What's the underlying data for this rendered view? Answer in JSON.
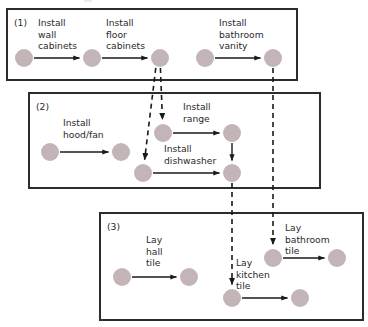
{
  "diagram": {
    "type": "precedence-network",
    "colors": {
      "node_fill": "#c3b4b8",
      "box_stroke": "#2c2c2c",
      "edge_solid": "#1a1a1a",
      "edge_dashed": "#1a1a1a",
      "background": "#ffffff"
    },
    "groups": [
      {
        "id": "group-1",
        "number": "(1)",
        "box": {
          "x": 7,
          "y": 9,
          "w": 290,
          "h": 71
        },
        "tasks": [
          {
            "id": "install-wall-cabinets",
            "label_lines": [
              "Install",
              "wall",
              "cabinets"
            ],
            "label_x": 38,
            "label_y": 26,
            "from": {
              "x": 24,
              "y": 58
            },
            "to": {
              "x": 92,
              "y": 58
            }
          },
          {
            "id": "install-floor-cabinets",
            "label_lines": [
              "Install",
              "floor",
              "cabinets"
            ],
            "label_x": 106,
            "label_y": 26,
            "from": {
              "x": 92,
              "y": 58
            },
            "to": {
              "x": 160,
              "y": 58
            }
          },
          {
            "id": "install-bathroom-vanity",
            "label_lines": [
              "Install",
              "bathroom",
              "vanity"
            ],
            "label_x": 219,
            "label_y": 26,
            "from": {
              "x": 205,
              "y": 58
            },
            "to": {
              "x": 273,
              "y": 58
            }
          }
        ]
      },
      {
        "id": "group-2",
        "number": "(2)",
        "box": {
          "x": 29,
          "y": 93,
          "w": 291,
          "h": 95
        },
        "tasks": [
          {
            "id": "install-hood-fan",
            "label_lines": [
              "Install",
              "hood/fan"
            ],
            "label_x": 63,
            "label_y": 126,
            "from": {
              "x": 50,
              "y": 152
            },
            "to": {
              "x": 121,
              "y": 152
            }
          },
          {
            "id": "install-range",
            "label_lines": [
              "Install",
              "range"
            ],
            "label_x": 183,
            "label_y": 110,
            "from": {
              "x": 163,
              "y": 133
            },
            "to": {
              "x": 232,
              "y": 133
            }
          },
          {
            "id": "install-dishwasher",
            "label_lines": [
              "Install",
              "dishwasher"
            ],
            "label_x": 164,
            "label_y": 152,
            "from": {
              "x": 143,
              "y": 173
            },
            "to": {
              "x": 232,
              "y": 173
            }
          }
        ]
      },
      {
        "id": "group-3",
        "number": "(3)",
        "box": {
          "x": 100,
          "y": 213,
          "w": 263,
          "h": 107
        },
        "tasks": [
          {
            "id": "lay-hall-tile",
            "label_lines": [
              "Lay",
              "hall",
              "tile"
            ],
            "label_x": 146,
            "label_y": 243,
            "from": {
              "x": 122,
              "y": 277
            },
            "to": {
              "x": 189,
              "y": 277
            }
          },
          {
            "id": "lay-bathroom-tile",
            "label_lines": [
              "Lay",
              "bathroom",
              "tile"
            ],
            "label_x": 285,
            "label_y": 231,
            "from": {
              "x": 273,
              "y": 258
            },
            "to": {
              "x": 337,
              "y": 258
            }
          },
          {
            "id": "lay-kitchen-tile",
            "label_lines": [
              "Lay",
              "kitchen",
              "tile"
            ],
            "label_x": 236,
            "label_y": 266,
            "from": {
              "x": 232,
              "y": 298
            },
            "to": {
              "x": 300,
              "y": 298
            }
          }
        ]
      }
    ],
    "internal_links": [
      {
        "id": "range-to-dishwasher-end",
        "from": {
          "x": 232,
          "y": 133
        },
        "to": {
          "x": 232,
          "y": 173
        }
      }
    ],
    "cross_group_links": [
      {
        "id": "floor-cabinets-to-range",
        "from": {
          "x": 160,
          "y": 58
        },
        "to": {
          "x": 163,
          "y": 133
        },
        "style": "dashed"
      },
      {
        "id": "floor-cabinets-to-dishwasher",
        "from": {
          "x": 157,
          "y": 58
        },
        "to": {
          "x": 143,
          "y": 173
        },
        "style": "dashed"
      },
      {
        "id": "dishwasher-end-to-kitchen-tile",
        "from": {
          "x": 232,
          "y": 173
        },
        "to": {
          "x": 232,
          "y": 298
        },
        "style": "dashed"
      },
      {
        "id": "bathroom-vanity-to-bathroom-tile",
        "from": {
          "x": 273,
          "y": 58
        },
        "to": {
          "x": 273,
          "y": 258
        },
        "style": "dashed"
      }
    ]
  }
}
